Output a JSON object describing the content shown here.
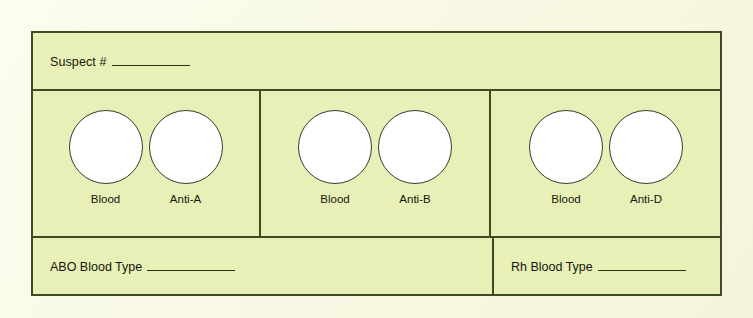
{
  "document": {
    "type": "blood-typing-worksheet",
    "background_color": "#e8f0b8",
    "page_color": "#fbfbe8",
    "border_color": "#3e4a22",
    "well_fill_color": "#ffffff",
    "well_stroke_color": "#3a3a30"
  },
  "header": {
    "suspect_label": "Suspect #",
    "suspect_value": ""
  },
  "panels": [
    {
      "id": "panel-abo-a",
      "wells": [
        {
          "name": "blood-well-a",
          "label": "Blood",
          "value": ""
        },
        {
          "name": "anti-a-well",
          "label": "Anti-A",
          "value": ""
        }
      ]
    },
    {
      "id": "panel-abo-b",
      "wells": [
        {
          "name": "blood-well-b",
          "label": "Blood",
          "value": ""
        },
        {
          "name": "anti-b-well",
          "label": "Anti-B",
          "value": ""
        }
      ]
    },
    {
      "id": "panel-rh-d",
      "wells": [
        {
          "name": "blood-well-d",
          "label": "Blood",
          "value": ""
        },
        {
          "name": "anti-d-well",
          "label": "Anti-D",
          "value": ""
        }
      ]
    }
  ],
  "results": {
    "abo_label": "ABO Blood Type",
    "abo_value": "",
    "rh_label": "Rh Blood Type",
    "rh_value": ""
  }
}
